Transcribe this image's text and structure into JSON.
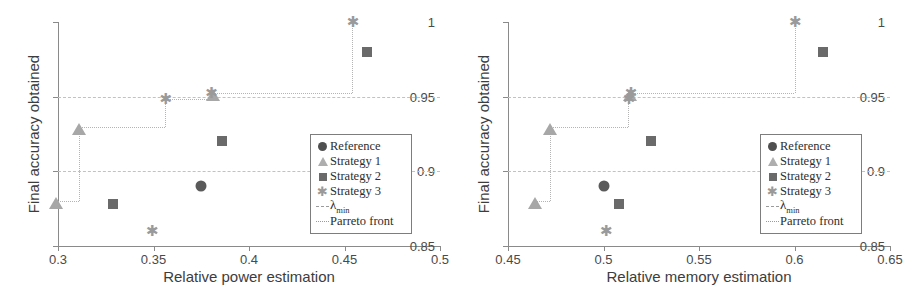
{
  "chart_data": [
    {
      "panel": "left",
      "type": "scatter",
      "title": "",
      "xlabel": "Relative power estimation",
      "ylabel": "Final accuracy obtained",
      "xlim": [
        0.3,
        0.5
      ],
      "ylim": [
        0.85,
        1.0
      ],
      "xticks": [
        0.3,
        0.35,
        0.4,
        0.45,
        0.5
      ],
      "xticklabels": [
        "0.3",
        "0.35",
        "0.4",
        "0.45",
        "0.5"
      ],
      "yticks": [
        0.85,
        0.9,
        0.95,
        1.0
      ],
      "yticklabels": [
        "0.85",
        "0.9",
        "0.95",
        "1"
      ],
      "grid": true,
      "legend_position": "lower right",
      "series": [
        {
          "name": "Reference",
          "marker": "circle",
          "color": "#5a5a5a",
          "points": [
            [
              0.375,
              0.89
            ]
          ]
        },
        {
          "name": "Strategy 1",
          "marker": "triangle",
          "color": "#a7a7a7",
          "points": [
            [
              0.299,
              0.88
            ],
            [
              0.311,
              0.93
            ],
            [
              0.381,
              0.9525
            ]
          ]
        },
        {
          "name": "Strategy 2",
          "marker": "square",
          "color": "#6a6a6a",
          "points": [
            [
              0.329,
              0.878
            ],
            [
              0.386,
              0.92
            ],
            [
              0.462,
              0.98
            ]
          ]
        },
        {
          "name": "Strategy 3",
          "marker": "star",
          "color": "#9a9a9a",
          "points": [
            [
              0.349,
              0.86
            ],
            [
              0.356,
              0.9485
            ],
            [
              0.38,
              0.9525
            ],
            [
              0.454,
              1.0
            ]
          ]
        }
      ],
      "pareto_front": [
        [
          0.299,
          0.88
        ],
        [
          0.311,
          0.88
        ],
        [
          0.311,
          0.93
        ],
        [
          0.356,
          0.93
        ],
        [
          0.356,
          0.9485
        ],
        [
          0.38,
          0.9485
        ],
        [
          0.38,
          0.9525
        ],
        [
          0.454,
          0.9525
        ],
        [
          0.454,
          1.0
        ]
      ],
      "lambda_min_lines": [
        0.9,
        0.95
      ]
    },
    {
      "panel": "right",
      "type": "scatter",
      "title": "",
      "xlabel": "Relative memory estimation",
      "ylabel": "Final accuracy obtained",
      "xlim": [
        0.45,
        0.65
      ],
      "ylim": [
        0.85,
        1.0
      ],
      "xticks": [
        0.45,
        0.5,
        0.55,
        0.6,
        0.65
      ],
      "xticklabels": [
        "0.45",
        "0.5",
        "0.55",
        "0.6",
        "0.65"
      ],
      "yticks": [
        0.85,
        0.9,
        0.95,
        1.0
      ],
      "yticklabels": [
        "0.85",
        "0.9",
        "0.95",
        "1"
      ],
      "grid": true,
      "legend_position": "lower right",
      "series": [
        {
          "name": "Reference",
          "marker": "circle",
          "color": "#5a5a5a",
          "points": [
            [
              0.5,
              0.89
            ]
          ]
        },
        {
          "name": "Strategy 1",
          "marker": "triangle",
          "color": "#a7a7a7",
          "points": [
            [
              0.464,
              0.88
            ],
            [
              0.472,
              0.93
            ],
            [
              0.514,
              0.9525
            ]
          ]
        },
        {
          "name": "Strategy 2",
          "marker": "square",
          "color": "#6a6a6a",
          "points": [
            [
              0.508,
              0.878
            ],
            [
              0.525,
              0.92
            ],
            [
              0.615,
              0.98
            ]
          ]
        },
        {
          "name": "Strategy 3",
          "marker": "star",
          "color": "#9a9a9a",
          "points": [
            [
              0.501,
              0.86
            ],
            [
              0.513,
              0.9485
            ],
            [
              0.514,
              0.9525
            ],
            [
              0.6,
              1.0
            ]
          ]
        }
      ],
      "pareto_front": [
        [
          0.464,
          0.88
        ],
        [
          0.472,
          0.88
        ],
        [
          0.472,
          0.93
        ],
        [
          0.513,
          0.93
        ],
        [
          0.513,
          0.9485
        ],
        [
          0.514,
          0.9485
        ],
        [
          0.514,
          0.9525
        ],
        [
          0.6,
          0.9525
        ],
        [
          0.6,
          1.0
        ]
      ],
      "lambda_min_lines": [
        0.9,
        0.95
      ]
    }
  ],
  "legend": {
    "items": [
      {
        "key": "circle",
        "label": "Reference"
      },
      {
        "key": "triangle",
        "label": "Strategy 1"
      },
      {
        "key": "square",
        "label": "Strategy 2"
      },
      {
        "key": "star",
        "label": "Strategy 3"
      },
      {
        "key": "dashdot",
        "label": "λmin",
        "lambda": true,
        "base": "λ",
        "sub": "min"
      },
      {
        "key": "dot",
        "label": "Parreto front"
      }
    ]
  }
}
